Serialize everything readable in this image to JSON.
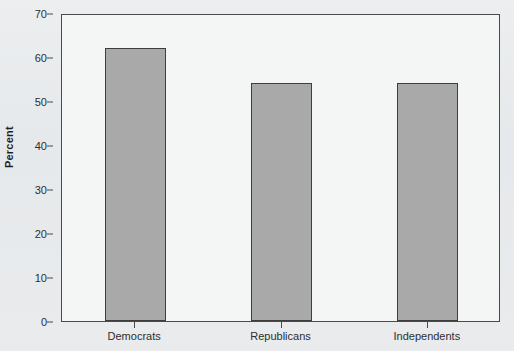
{
  "title_fragment": "Party Support",
  "chart_data": {
    "type": "bar",
    "title": "",
    "xlabel": "",
    "ylabel": "Percent",
    "categories": [
      "Democrats",
      "Republicans",
      "Independents"
    ],
    "values": [
      62,
      54,
      54
    ],
    "ylim": [
      0,
      70
    ],
    "yticks": [
      0,
      10,
      20,
      30,
      40,
      50,
      60,
      70
    ],
    "ytick_labels": [
      "0",
      "10",
      "20",
      "30",
      "40",
      "50",
      "60",
      "70"
    ],
    "grid": false,
    "legend": "none",
    "bar_fill_color": "#a9a9a9",
    "bar_border_color": "#3d3d3d",
    "plot_background_color": "#f4f6f6",
    "page_background_color": "#e9ebed",
    "axis_color": "#4a4a4a"
  }
}
